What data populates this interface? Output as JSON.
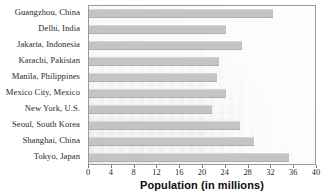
{
  "chart_data": {
    "type": "bar",
    "orientation": "horizontal",
    "title": "",
    "xlabel": "Population (in millions)",
    "ylabel": "",
    "xlim": [
      0,
      40
    ],
    "xticks": [
      0,
      4,
      8,
      12,
      16,
      20,
      24,
      28,
      32,
      36,
      40
    ],
    "grid": false,
    "legend": null,
    "bar_color": "#c3c5c2",
    "categories": [
      "Guangzhou, China",
      "Delhi, India",
      "Jakarta, Indonesia",
      "Karachi, Pakistan",
      "Manila, Philippines",
      "Mexico City, Mexico",
      "New York, U.S.",
      "Seoul, South Korea",
      "Shanghai, China",
      "Tokyo, Japan"
    ],
    "values": [
      32.3,
      24.0,
      26.8,
      22.8,
      22.5,
      24.0,
      21.5,
      26.5,
      29.0,
      35.0
    ]
  },
  "axis": {
    "tick_labels": [
      "0",
      "4",
      "8",
      "12",
      "16",
      "20",
      "24",
      "28",
      "32",
      "36",
      "40"
    ],
    "title": "Population (in millions)"
  }
}
